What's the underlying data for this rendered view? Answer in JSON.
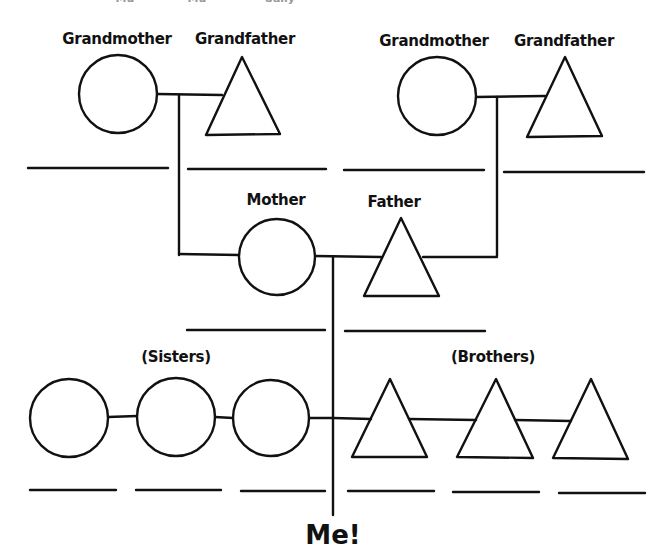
{
  "diagram": {
    "type": "family-tree-worksheet",
    "top_cut_text": [
      "Mu",
      "Mu",
      "Sally"
    ],
    "grandparents_paternal_side": {
      "grandmother_label": "Grandmother",
      "grandfather_label": "Grandfather"
    },
    "grandparents_maternal_side": {
      "grandmother_label": "Grandmother",
      "grandfather_label": "Grandfather"
    },
    "parents": {
      "mother_label": "Mother",
      "father_label": "Father"
    },
    "siblings": {
      "sisters_label": "(Sisters)",
      "brothers_label": "(Brothers)",
      "sister_count": 3,
      "brother_count": 3
    },
    "self_label": "Me!",
    "line_color": "#111111",
    "background": "#ffffff"
  }
}
